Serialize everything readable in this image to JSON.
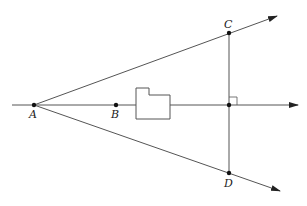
{
  "diagram": {
    "points": {
      "A": "A",
      "B": "B",
      "C": "C",
      "D": "D"
    },
    "right_angle_marker": true,
    "colors": {
      "stroke": "#555555",
      "point": "#111111",
      "label": "#222222"
    }
  }
}
